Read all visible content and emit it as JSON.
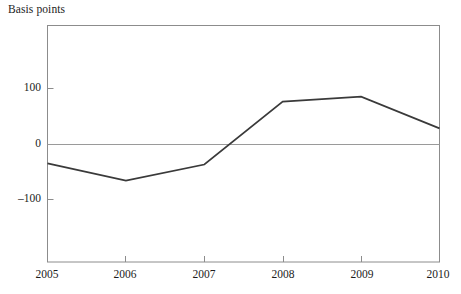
{
  "chart_data": {
    "type": "line",
    "title": "",
    "ylabel": "Basis points",
    "xlabel": "",
    "x": [
      2005,
      2006,
      2007,
      2008,
      2009,
      2010
    ],
    "categories": [
      "2005",
      "2006",
      "2007",
      "2008",
      "2009",
      "2010"
    ],
    "values": [
      -34,
      -65,
      -36,
      77,
      86,
      29
    ],
    "series": [
      {
        "name": "Basis points",
        "values": [
          -34,
          -65,
          -36,
          77,
          86,
          29
        ]
      }
    ],
    "ylim": [
      -160,
      265
    ],
    "xlim": [
      2005,
      2010
    ],
    "yticks": [
      100,
      0,
      -100
    ],
    "ytick_labels": [
      "100",
      "0",
      "–100"
    ],
    "xticks": [
      2005,
      2006,
      2007,
      2008,
      2009,
      2010
    ],
    "xtick_labels": [
      "2005",
      "2006",
      "2007",
      "2008",
      "2009",
      "2010"
    ],
    "grid": false,
    "legend": "none",
    "zero_line": true,
    "line_color": "#3a3a3a",
    "zero_line_color": "#9a9a9a",
    "frame_color": "#8c8c8c",
    "background": "#ffffff"
  },
  "axis": {
    "y_title": "Basis points",
    "y_ticks": [
      {
        "label": "100",
        "value": 100
      },
      {
        "label": "0",
        "value": 0
      },
      {
        "label": "–100",
        "value": -100
      }
    ],
    "x_ticks": [
      {
        "label": "2005",
        "value": 2005
      },
      {
        "label": "2006",
        "value": 2006
      },
      {
        "label": "2007",
        "value": 2007
      },
      {
        "label": "2008",
        "value": 2008
      },
      {
        "label": "2009",
        "value": 2009
      },
      {
        "label": "2010",
        "value": 2010
      }
    ]
  }
}
